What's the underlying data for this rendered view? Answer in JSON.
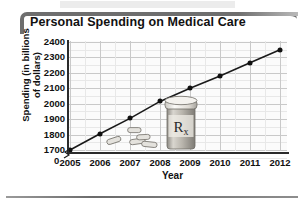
{
  "title": "Personal Spending on Medical Care",
  "axes": {
    "ylabel_line1": "Spending (in billions",
    "ylabel_line2": "of dollars)",
    "xlabel": "Year",
    "zero_label": "0"
  },
  "artwork": {
    "bottle_label": "R",
    "bottle_label_sub": "x",
    "bottle_name": "prescription-pill-bottle",
    "pill_count": 5
  },
  "colors": {
    "frame": "#6e6e6e",
    "line": "#1a1a1a",
    "marker": "#111111",
    "grid": "#c9c9c9",
    "plot_background": "#fbfbfb",
    "text": "#111111"
  },
  "chart_data": {
    "type": "line",
    "title": "Personal Spending on Medical Care",
    "xlabel": "Year",
    "ylabel": "Spending (in billions of dollars)",
    "x": [
      2005,
      2006,
      2007,
      2008,
      2009,
      2010,
      2011,
      2012
    ],
    "categories": [
      "2005",
      "2006",
      "2007",
      "2008",
      "2009",
      "2010",
      "2011",
      "2012"
    ],
    "values": [
      1700,
      1805,
      1905,
      2015,
      2100,
      2180,
      2265,
      2350
    ],
    "series": [
      {
        "name": "Personal spending on medical care",
        "values": [
          1700,
          1805,
          1905,
          2015,
          2100,
          2180,
          2265,
          2350
        ]
      }
    ],
    "ylim": [
      1700,
      2400
    ],
    "yticks": [
      1700,
      1800,
      1900,
      2000,
      2100,
      2200,
      2300,
      2400
    ],
    "ytick_labels": [
      "1700",
      "1800",
      "1900",
      "2000",
      "2100",
      "2200",
      "2300",
      "2400"
    ],
    "xticks": [
      2005,
      2006,
      2007,
      2008,
      2009,
      2010,
      2011,
      2012
    ],
    "xtick_labels": [
      "2005",
      "2006",
      "2007",
      "2008",
      "2009",
      "2010",
      "2011",
      "2012"
    ],
    "axis_break": true,
    "axis_break_note": "0",
    "grid": true,
    "legend": "none",
    "markers": "filled-circle"
  }
}
